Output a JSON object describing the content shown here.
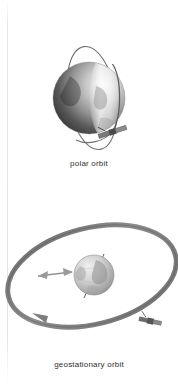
{
  "page": {
    "background_color": "#ffffff",
    "width": 178,
    "height": 384
  },
  "figures": [
    {
      "id": "polar-orbit",
      "caption": "polar orbit",
      "elements": {
        "earth_label": "earth-globe",
        "orbit_ring_label": "polar-orbit-ring",
        "satellite_label": "satellite"
      },
      "colors": {
        "globe_dark": "#3a3a3a",
        "globe_mid": "#8c8c8c",
        "globe_light": "#e6e6e6",
        "orbit_ring": "#6b6b6b",
        "satellite_body": "#4a4a4a"
      }
    },
    {
      "id": "geostationary-orbit",
      "caption": "geostationary orbit",
      "elements": {
        "earth_label": "earth-globe",
        "orbit_ring_label": "geostationary-orbit-ring",
        "satellite_label": "satellite",
        "radius_arrow_label": "orbit-radius-arrow",
        "axis_label": "earth-rotation-axis"
      },
      "colors": {
        "globe_dark": "#9a9a9a",
        "globe_light": "#e3e3e3",
        "orbit_ring": "#7c7c7c",
        "orbit_ring_dark": "#5e5e5e",
        "arrow": "#8f8f8f",
        "satellite_body": "#5a5a5a"
      }
    }
  ],
  "caption_style": {
    "color": "#2f2f2f",
    "font_size_px": 8
  }
}
